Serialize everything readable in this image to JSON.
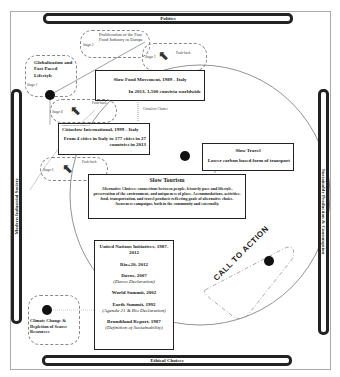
{
  "frame_bars": {
    "top": "Politics",
    "bottom": "Ethical Choices",
    "left": "Modern Industrial Society",
    "right": "Sustainable Production & Consumption"
  },
  "stages": {
    "stage1": {
      "label": "Stage 1",
      "title": "Globalization and Fast Paced Lifestyle"
    },
    "stage2": {
      "label": "Stage 2",
      "title": "Proliferation of the Fast Food Industry in Europe"
    },
    "stage3": {
      "label": "Stage 3",
      "pushback": "Push-back"
    },
    "stage4": {
      "label": "Stage 4",
      "pushback": "Push-back"
    },
    "stage5": {
      "label": "Stage 5",
      "pushback": "Push-back"
    }
  },
  "slow_food": {
    "title": "Slow Food Movement, 1989 - Italy",
    "subtitle": "In 2013, 1,500 convivia worldwide"
  },
  "cittaslow_charter": "Cittaslow Charter",
  "cittaslow": {
    "header": "Founded as direct offshoot of",
    "title": "Cittaslow International, 1999 - Italy",
    "subtitle": "From 4 cities in Italy to 177 cities in 27 countries in 2013"
  },
  "slow_travel": {
    "title": "Slow Travel",
    "subtitle": "Lower carbon based form of transport"
  },
  "slow_tourism": {
    "title": "Slow Tourism",
    "body": "Alternative Choices: connections between people, leisurely pace and lifestyle, preservation of the environment, and uniqueness of place. Accommodations, activities, food, transportation, and travel products reflecting goals of alternative choice. Awareness campaigns, both in the community and externally."
  },
  "un_initiatives": {
    "title": "United Nations Initiatives, 1987-2012",
    "items": [
      {
        "name": "Rio+20, 2012",
        "note": ""
      },
      {
        "name": "Davos, 2007",
        "note": "(Davos Declaration)"
      },
      {
        "name": "World Summit, 2002",
        "note": ""
      },
      {
        "name": "Earth Summit, 1992",
        "note": "(Agenda 21 & Rio Declaration)"
      },
      {
        "name": "Brundtland Report, 1987",
        "note": "(Definition of Sustainability)"
      }
    ]
  },
  "call_to_action": "CALL TO ACTION",
  "climate": "Climate Change & Depletion of Scarce Resources"
}
